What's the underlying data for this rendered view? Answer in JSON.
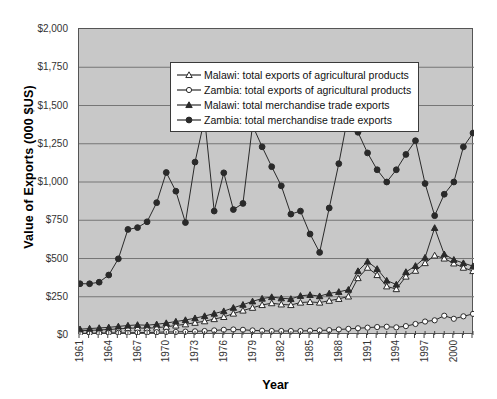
{
  "chart_data": {
    "type": "line",
    "title": "",
    "xlabel": "Year",
    "ylabel": "Value of Exports (000 $US)",
    "ylim": [
      0,
      2000
    ],
    "ytick_step": 250,
    "ytick_labels": [
      "$2,000",
      "$1,750",
      "$1,500",
      "$1,250",
      "$1,000",
      "$750",
      "$500",
      "$250",
      "$0"
    ],
    "ytick_values": [
      2000,
      1750,
      1500,
      1250,
      1000,
      750,
      500,
      250,
      0
    ],
    "grid": true,
    "legend_position": "top-left inside plot",
    "plot_background": "#c8c8c8",
    "xlim": [
      1961,
      2002
    ],
    "xtick_labels": [
      "1961",
      "1964",
      "1967",
      "1970",
      "1973",
      "1976",
      "1979",
      "1982",
      "1985",
      "1988",
      "1991",
      "1994",
      "1997",
      "2000"
    ],
    "xtick_values": [
      1961,
      1964,
      1967,
      1970,
      1973,
      1976,
      1979,
      1982,
      1985,
      1988,
      1991,
      1994,
      1997,
      2000
    ],
    "x": [
      1961,
      1962,
      1963,
      1964,
      1965,
      1966,
      1967,
      1968,
      1969,
      1970,
      1971,
      1972,
      1973,
      1974,
      1975,
      1976,
      1977,
      1978,
      1979,
      1980,
      1981,
      1982,
      1983,
      1984,
      1985,
      1986,
      1987,
      1988,
      1989,
      1990,
      1991,
      1992,
      1993,
      1994,
      1995,
      1996,
      1997,
      1998,
      1999,
      2000,
      2001,
      2002
    ],
    "series": [
      {
        "name": "Malawi: total exports of agricultural products",
        "marker": "open-triangle",
        "color": "#2a2a2a",
        "values": [
          28,
          30,
          33,
          36,
          40,
          44,
          46,
          44,
          48,
          54,
          62,
          70,
          80,
          90,
          104,
          118,
          140,
          160,
          178,
          196,
          208,
          200,
          196,
          212,
          216,
          212,
          224,
          236,
          252,
          372,
          440,
          392,
          318,
          300,
          382,
          420,
          470,
          520,
          500,
          468,
          440,
          418
        ]
      },
      {
        "name": "Zambia: total exports of agricultural products",
        "marker": "open-circle",
        "color": "#2a2a2a",
        "values": [
          10,
          12,
          12,
          14,
          14,
          14,
          16,
          16,
          18,
          20,
          20,
          22,
          24,
          26,
          30,
          34,
          36,
          34,
          30,
          28,
          26,
          26,
          26,
          26,
          28,
          30,
          32,
          36,
          40,
          44,
          48,
          52,
          54,
          50,
          58,
          72,
          88,
          96,
          126,
          106,
          122,
          138
        ]
      },
      {
        "name": "Malawi: total merchandise trade exports",
        "marker": "filled-triangle",
        "color": "#2a2a2a",
        "values": [
          38,
          42,
          46,
          50,
          56,
          62,
          66,
          64,
          70,
          78,
          88,
          98,
          110,
          124,
          140,
          156,
          178,
          198,
          220,
          238,
          248,
          240,
          236,
          256,
          262,
          254,
          272,
          282,
          296,
          418,
          480,
          432,
          356,
          330,
          412,
          452,
          506,
          700,
          528,
          492,
          470,
          450
        ]
      },
      {
        "name": "Zambia: total merchandise trade exports",
        "marker": "filled-circle",
        "color": "#2a2a2a",
        "values": [
          335,
          335,
          345,
          392,
          498,
          690,
          702,
          740,
          865,
          1062,
          940,
          735,
          1130,
          1415,
          810,
          1060,
          820,
          860,
          1370,
          1230,
          1100,
          975,
          790,
          810,
          660,
          540,
          830,
          1120,
          1445,
          1325,
          1190,
          1080,
          1000,
          1080,
          1180,
          1270,
          990,
          780,
          920,
          1000,
          1230,
          1320
        ]
      }
    ]
  },
  "top_clipped_text": ""
}
